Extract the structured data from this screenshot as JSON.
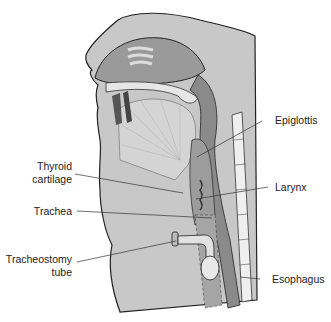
{
  "diagram": {
    "labels": {
      "epiglottis": "Epiglottis",
      "thyroid_cartilage_1": "Thyroid",
      "thyroid_cartilage_2": "cartilage",
      "larynx": "Larynx",
      "trachea": "Trachea",
      "tracheostomy_1": "Tracheostomy",
      "tracheostomy_2": "tube",
      "esophagus": "Esophagus"
    }
  }
}
